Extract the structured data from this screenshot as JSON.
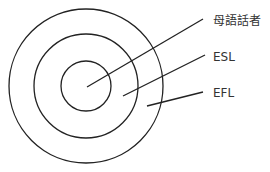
{
  "diagram": {
    "type": "concentric-circles",
    "center": [
      86,
      86
    ],
    "circles": [
      {
        "name": "outer",
        "r": 77
      },
      {
        "name": "middle",
        "r": 52
      },
      {
        "name": "inner",
        "r": 25
      }
    ],
    "stroke_color": "#222222",
    "labels": [
      {
        "text": "母語話者",
        "x": 213,
        "y": 14,
        "line": [
          87,
          87,
          203,
          19
        ]
      },
      {
        "text": "ESL",
        "x": 213,
        "y": 50,
        "line": [
          123,
          96,
          205,
          55
        ]
      },
      {
        "text": "EFL",
        "x": 213,
        "y": 86,
        "line": [
          147,
          106,
          203,
          92
        ]
      }
    ]
  }
}
